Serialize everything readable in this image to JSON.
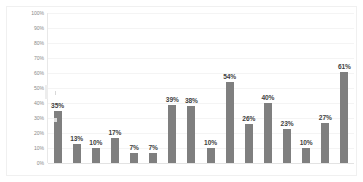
{
  "chart_data": {
    "type": "bar",
    "title": "",
    "subtitle": "",
    "xlabel": "",
    "ylabel": "",
    "ylim": [
      0,
      100
    ],
    "grid": true,
    "legend": null,
    "legend_position": "none",
    "unit": "%",
    "y_ticks": [
      "0%",
      "10%",
      "20%",
      "30%",
      "40%",
      "50%",
      "60%",
      "70%",
      "80%",
      "90%",
      "100%"
    ],
    "y_tick_values": [
      0,
      10,
      20,
      30,
      40,
      50,
      60,
      70,
      80,
      90,
      100
    ],
    "categories": [
      "",
      "",
      "",
      "",
      "",
      "",
      "",
      "",
      "",
      "",
      "",
      "",
      "",
      "",
      "",
      ""
    ],
    "values": [
      35,
      13,
      10,
      17,
      7,
      7,
      39,
      38,
      10,
      54,
      26,
      40,
      23,
      10,
      27,
      61
    ],
    "data_labels": [
      "35%",
      "13%",
      "10%",
      "17%",
      "7%",
      "7%",
      "39%",
      "38%",
      "10%",
      "54%",
      "26%",
      "40%",
      "23%",
      "10%",
      "27%",
      "61%"
    ],
    "bar_color": "#7f7f7f",
    "label_color": "#3f3f3f",
    "gridline_color": "#f4f4f4",
    "axis_color": "#e8e8e8",
    "tick_label_color": "#8a8a8a",
    "background_color": "#ffffff"
  }
}
